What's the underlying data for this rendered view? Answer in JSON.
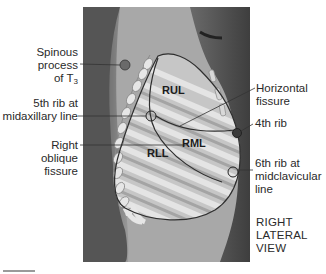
{
  "figure": {
    "view_label": [
      "RIGHT",
      "LATERAL",
      "VIEW"
    ],
    "lobes": {
      "upper": "RUL",
      "middle": "RML",
      "lower": "RLL"
    },
    "callouts_left": {
      "spinous": [
        "Spinous",
        "process",
        "of T"
      ],
      "spinous_sub": "3",
      "fifth_rib": [
        "5th rib at",
        "midaxillary line"
      ],
      "oblique": [
        "Right",
        "oblique",
        "fissure"
      ]
    },
    "callouts_right": {
      "horizontal": [
        "Horizontal",
        "fissure"
      ],
      "fourth_rib": "4th rib",
      "sixth_rib": [
        "6th rib at",
        "midclavicular",
        "line"
      ]
    },
    "colors": {
      "background": "#ffffff",
      "body_dark": "#4a4a4a",
      "body_light": "#b8b8b8",
      "lung_fill": "#c9c9c9",
      "rib": "#e2e2e2",
      "rib_shadow": "#9a9a9a",
      "line": "#2a2a2a"
    }
  }
}
